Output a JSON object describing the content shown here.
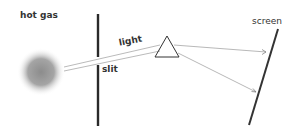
{
  "diagram": {
    "labels": {
      "source": "hot gas",
      "beam": "light",
      "aperture": "slit",
      "detector": "screen"
    },
    "colors": {
      "ink": "#2a2a2a",
      "beam": "#9a9a9a",
      "gas": "#8c8c8c"
    }
  }
}
